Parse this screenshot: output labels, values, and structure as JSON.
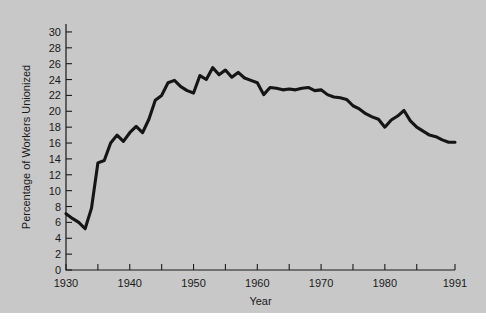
{
  "figure": {
    "background_color": "#c8c8c8",
    "line_color": "#151515",
    "axis_color": "#1a1a1a"
  },
  "chart_data": {
    "type": "line",
    "title": "",
    "xlabel": "Year",
    "ylabel": "Percentage of Workers Unionized",
    "xlim": [
      1930,
      1991
    ],
    "ylim": [
      0,
      31
    ],
    "grid": false,
    "legend": null,
    "x_tick_labels": [
      "1930",
      "1940",
      "1950",
      "1960",
      "1970",
      "1980",
      "1991"
    ],
    "x_tick_values": [
      1930,
      1940,
      1950,
      1960,
      1970,
      1980,
      1991
    ],
    "x_minor_tick_values": [
      1935,
      1945,
      1955,
      1965,
      1975,
      1985
    ],
    "y_tick_labels": [
      "0",
      "2",
      "4",
      "6",
      "8",
      "10",
      "12",
      "14",
      "16",
      "18",
      "20",
      "22",
      "24",
      "26",
      "28",
      "30"
    ],
    "y_tick_values": [
      0,
      2,
      4,
      6,
      8,
      10,
      12,
      14,
      16,
      18,
      20,
      22,
      24,
      26,
      28,
      30
    ],
    "series": [
      {
        "name": "Percentage of Workers Unionized",
        "x": [
          1930,
          1931,
          1932,
          1933,
          1934,
          1935,
          1936,
          1937,
          1938,
          1939,
          1940,
          1941,
          1942,
          1943,
          1944,
          1945,
          1946,
          1947,
          1948,
          1949,
          1950,
          1951,
          1952,
          1953,
          1954,
          1955,
          1956,
          1957,
          1958,
          1959,
          1960,
          1961,
          1962,
          1963,
          1964,
          1965,
          1966,
          1967,
          1968,
          1969,
          1970,
          1971,
          1972,
          1973,
          1974,
          1975,
          1976,
          1977,
          1978,
          1979,
          1980,
          1981,
          1982,
          1983,
          1984,
          1985,
          1986,
          1987,
          1988,
          1989,
          1990,
          1991
        ],
        "values": [
          7.1,
          6.5,
          6.0,
          5.2,
          7.8,
          13.5,
          13.8,
          16.0,
          17.0,
          16.2,
          17.3,
          18.1,
          17.3,
          19.0,
          21.4,
          22.0,
          23.6,
          23.9,
          23.1,
          22.6,
          22.3,
          24.5,
          24.0,
          25.5,
          24.6,
          25.2,
          24.3,
          24.9,
          24.2,
          23.9,
          23.6,
          22.1,
          23.0,
          22.9,
          22.7,
          22.8,
          22.7,
          22.9,
          23.0,
          22.6,
          22.7,
          22.1,
          21.8,
          21.7,
          21.5,
          20.7,
          20.3,
          19.7,
          19.3,
          19.0,
          18.0,
          18.9,
          19.4,
          20.1,
          18.8,
          18.0,
          17.5,
          17.0,
          16.8,
          16.4,
          16.1,
          16.1
        ]
      }
    ]
  }
}
